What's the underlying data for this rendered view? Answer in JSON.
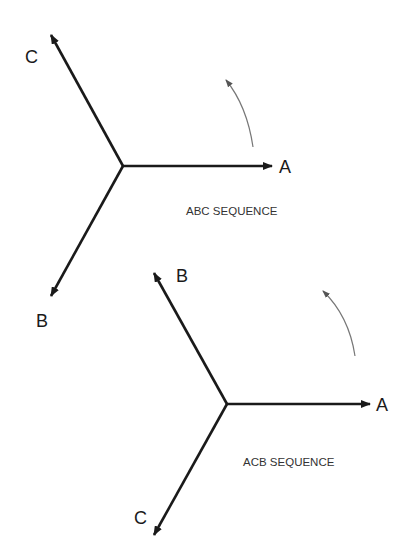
{
  "diagrams": [
    {
      "title": "ABC SEQUENCE",
      "phasors": [
        {
          "label": "A",
          "angle_deg": 0
        },
        {
          "label": "C",
          "angle_deg": 120
        },
        {
          "label": "B",
          "angle_deg": 240
        }
      ],
      "rotation": "counterclockwise"
    },
    {
      "title": "ACB SEQUENCE",
      "phasors": [
        {
          "label": "A",
          "angle_deg": 0
        },
        {
          "label": "B",
          "angle_deg": 120
        },
        {
          "label": "C",
          "angle_deg": 240
        }
      ],
      "rotation": "counterclockwise"
    }
  ],
  "colors": {
    "line": "#1a1a1a",
    "rotation_arrow": "#777777"
  }
}
